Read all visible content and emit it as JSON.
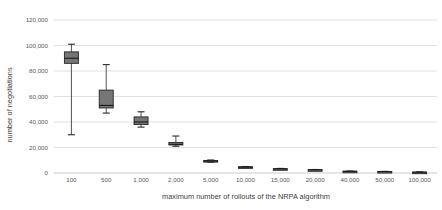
{
  "chart_data": {
    "type": "box",
    "title": "",
    "xlabel": "maximum number of rollouts of the NRPA algorithm",
    "ylabel": "number of negotiations",
    "ylim": [
      0,
      120000
    ],
    "yticks": [
      0,
      20000,
      40000,
      60000,
      80000,
      100000,
      120000
    ],
    "ytick_labels": [
      "0",
      "20,000",
      "40,000",
      "60,000",
      "80,000",
      "100,000",
      "120,000"
    ],
    "grid": true,
    "legend": "none",
    "categories": [
      "100",
      "500",
      "1,000",
      "2,000",
      "5,000",
      "10,000",
      "15,000",
      "20,000",
      "40,000",
      "50,000",
      "100,000"
    ],
    "boxes": [
      {
        "category": "100",
        "whisker_low": 30000,
        "q1": 86000,
        "median": 90000,
        "q3": 95000,
        "whisker_high": 101000
      },
      {
        "category": "500",
        "whisker_low": 47000,
        "q1": 51000,
        "median": 53000,
        "q3": 65000,
        "whisker_high": 85000
      },
      {
        "category": "1,000",
        "whisker_low": 36000,
        "q1": 38000,
        "median": 40000,
        "q3": 44000,
        "whisker_high": 48000
      },
      {
        "category": "2,000",
        "whisker_low": 21000,
        "q1": 22000,
        "median": 22500,
        "q3": 24000,
        "whisker_high": 29000
      },
      {
        "category": "5,000",
        "whisker_low": 8500,
        "q1": 9000,
        "median": 9300,
        "q3": 9800,
        "whisker_high": 10200
      },
      {
        "category": "10,000",
        "whisker_low": 4200,
        "q1": 4400,
        "median": 4600,
        "q3": 4900,
        "whisker_high": 5100
      },
      {
        "category": "15,000",
        "whisker_low": 3000,
        "q1": 3100,
        "median": 3200,
        "q3": 3400,
        "whisker_high": 3600
      },
      {
        "category": "20,000",
        "whisker_low": 2300,
        "q1": 2400,
        "median": 2500,
        "q3": 2600,
        "whisker_high": 2750
      },
      {
        "category": "40,000",
        "whisker_low": 1200,
        "q1": 1250,
        "median": 1300,
        "q3": 1400,
        "whisker_high": 1500
      },
      {
        "category": "50,000",
        "whisker_low": 1000,
        "q1": 1050,
        "median": 1100,
        "q3": 1200,
        "whisker_high": 1300
      },
      {
        "category": "100,000",
        "whisker_low": 500,
        "q1": 550,
        "median": 600,
        "q3": 700,
        "whisker_high": 800
      }
    ]
  },
  "colors": {
    "box_fill": "#767676",
    "box_stroke": "#262626",
    "gridline": "#d9d9d9",
    "tick_text": "#595959",
    "axis_title_text": "#404040",
    "background": "#ffffff"
  }
}
